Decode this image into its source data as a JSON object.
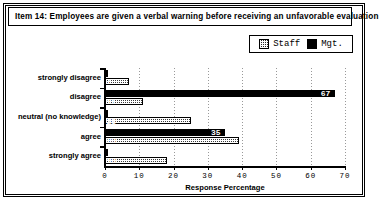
{
  "title": {
    "text": "Item 14:  Employees are given a verbal warning before receiving an unfavorable evaluation"
  },
  "legend": {
    "position": "top-right",
    "entries": [
      {
        "label": "Staff",
        "swatch": "hatched-dark",
        "color": "#2b2b2b"
      },
      {
        "label": "Mgt.",
        "swatch": "solid-black",
        "color": "#000000"
      }
    ]
  },
  "chart_data": {
    "type": "bar",
    "orientation": "horizontal",
    "title": "Item 14:  Employees are given a verbal warning before receiving an unfavorable evaluation",
    "xlabel": "Response Percentage",
    "ylabel": "",
    "xlim": [
      0,
      70
    ],
    "xticks": [
      0,
      10,
      20,
      30,
      40,
      50,
      60,
      70
    ],
    "xtick_labels": [
      "0",
      "10",
      "20",
      "30",
      "40",
      "50",
      "60",
      "70"
    ],
    "grid": true,
    "grid_axis": "x",
    "legend_position": "top-right",
    "categories": [
      "strongly  disagree",
      "disagree",
      "neutral (no knowledge)",
      "agree",
      "strongly  agree"
    ],
    "series": [
      {
        "name": "Staff",
        "color": "#2b2b2b",
        "values": [
          7,
          11,
          25,
          39,
          18
        ],
        "labels": [
          "7",
          "11",
          "25",
          "39",
          "18"
        ]
      },
      {
        "name": "Mgt.",
        "color": "#000000",
        "values": [
          0,
          67,
          0,
          35,
          0
        ],
        "labels": [
          "",
          "67",
          "",
          "35",
          ""
        ]
      }
    ]
  }
}
